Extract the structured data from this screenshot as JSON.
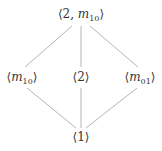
{
  "diagram": {
    "type": "hasse-diagram",
    "colors": {
      "edge": "#b5b5b5",
      "text": "#333333",
      "background": "#ffffff"
    },
    "nodes": [
      {
        "id": "top",
        "open": "⟨",
        "pre": "2, ",
        "var": "m",
        "sub": "10",
        "close": "⟩",
        "x": 81,
        "y": 14
      },
      {
        "id": "left",
        "open": "⟨",
        "pre": "",
        "var": "m",
        "sub": "10",
        "close": "⟩",
        "x": 22,
        "y": 77
      },
      {
        "id": "mid",
        "open": "⟨",
        "pre": "2",
        "var": "",
        "sub": "",
        "close": "⟩",
        "x": 81,
        "y": 77
      },
      {
        "id": "right",
        "open": "⟨",
        "pre": "",
        "var": "m",
        "sub": "01",
        "close": "⟩",
        "x": 140,
        "y": 77
      },
      {
        "id": "bottom",
        "open": "⟨",
        "pre": "1",
        "var": "",
        "sub": "",
        "close": "⟩",
        "x": 81,
        "y": 137
      }
    ],
    "edges": [
      {
        "from": "top",
        "to": "left",
        "x1": 72,
        "y1": 26,
        "x2": 25,
        "y2": 67
      },
      {
        "from": "top",
        "to": "mid",
        "x1": 81,
        "y1": 26,
        "x2": 81,
        "y2": 67
      },
      {
        "from": "top",
        "to": "right",
        "x1": 90,
        "y1": 26,
        "x2": 138,
        "y2": 67
      },
      {
        "from": "left",
        "to": "bottom",
        "x1": 27,
        "y1": 88,
        "x2": 76,
        "y2": 128
      },
      {
        "from": "mid",
        "to": "bottom",
        "x1": 81,
        "y1": 88,
        "x2": 81,
        "y2": 128
      },
      {
        "from": "right",
        "to": "bottom",
        "x1": 137,
        "y1": 88,
        "x2": 86,
        "y2": 128
      }
    ]
  }
}
